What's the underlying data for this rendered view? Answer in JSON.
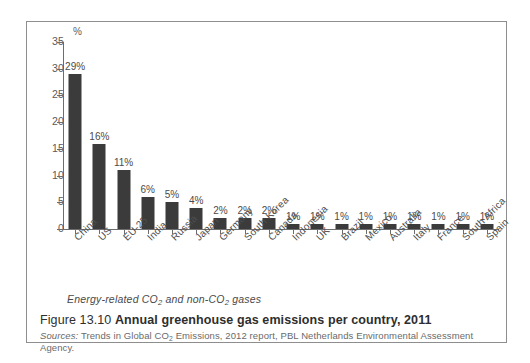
{
  "figure": {
    "caption_number": "Figure 13.10",
    "caption_title": "Annual greenhouse gas emissions per country, 2011",
    "sources_label": "Sources:",
    "sources_text": "Trends in Global CO₂ Emissions, 2012 report, PBL Netherlands Environmental Assessment Agency.",
    "note": "Energy-related CO₂ and non-CO₂ gases"
  },
  "chart_data": {
    "type": "bar",
    "title": "Annual greenhouse gas emissions per country, 2011",
    "subtitle": "Energy-related CO2 and non-CO2 gases",
    "xlabel": "",
    "ylabel": "%",
    "ylim": [
      0,
      35
    ],
    "ytick_step": 5,
    "yticks": [
      0,
      5,
      10,
      15,
      20,
      25,
      30,
      35
    ],
    "ytick_labels": [
      "0",
      "5",
      "10",
      "15",
      "20",
      "25",
      "30",
      "35"
    ],
    "grid": false,
    "legend": "none",
    "bar_color": "#3b3b3b",
    "categories": [
      "China",
      "US",
      "EU-25",
      "India",
      "Russia",
      "Japan",
      "Germany",
      "South Korea",
      "Canada",
      "Indonesia",
      "UK",
      "Brazil",
      "Mexico",
      "Australia",
      "Italy",
      "France",
      "South Africa",
      "Spain"
    ],
    "values": [
      29,
      16,
      11,
      6,
      5,
      4,
      2,
      2,
      2,
      1,
      1,
      1,
      1,
      1,
      1,
      1,
      1,
      1
    ],
    "data_labels": [
      "29%",
      "16%",
      "11%",
      "6%",
      "5%",
      "4%",
      "2%",
      "2%",
      "2%",
      "1%",
      "1%",
      "1%",
      "1%",
      "1%",
      "1%",
      "1%",
      "1%",
      "1%"
    ]
  }
}
